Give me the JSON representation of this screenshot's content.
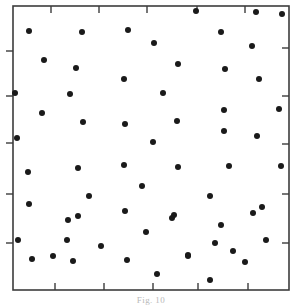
{
  "figure": {
    "title": "",
    "caption": "Fig. 10",
    "frame_color": "#3c3c3c",
    "point_color": "#1a1a1a",
    "background_color": "#ffffff"
  },
  "chart_data": {
    "type": "scatter",
    "title": "",
    "subtitle": "",
    "xlabel": "",
    "ylabel": "",
    "grid": false,
    "legend": null,
    "xlim": [
      0,
      100
    ],
    "ylim": [
      0,
      100
    ],
    "marker": "filled-circle",
    "marker_size_px": 4.2,
    "n_points": 62,
    "axes": {
      "top_ticks_x": [
        51,
        99,
        147,
        197,
        245
      ],
      "bottom_ticks_x": [
        55,
        104,
        153,
        198,
        248
      ],
      "left_ticks_y": [
        51,
        96,
        143,
        194,
        243
      ],
      "right_ticks_y": [
        48,
        96,
        144,
        194,
        243
      ],
      "tick_length_px": 7,
      "tick_direction": "inward",
      "left_tick_direction": "outward"
    },
    "frame": {
      "x": 13,
      "y": 6,
      "width": 276,
      "height": 284
    },
    "points_px": [
      [
        196,
        11
      ],
      [
        256,
        12
      ],
      [
        282,
        14
      ],
      [
        29,
        31
      ],
      [
        82,
        32
      ],
      [
        128,
        30
      ],
      [
        221,
        32
      ],
      [
        154,
        43
      ],
      [
        252,
        46
      ],
      [
        44,
        60
      ],
      [
        178,
        64
      ],
      [
        225,
        69
      ],
      [
        76,
        68
      ],
      [
        124,
        79
      ],
      [
        259,
        79
      ],
      [
        15,
        93
      ],
      [
        70,
        94
      ],
      [
        163,
        93
      ],
      [
        42,
        113
      ],
      [
        224,
        110
      ],
      [
        279,
        109
      ],
      [
        83,
        122
      ],
      [
        125,
        124
      ],
      [
        177,
        121
      ],
      [
        17,
        138
      ],
      [
        224,
        131
      ],
      [
        257,
        136
      ],
      [
        153,
        142
      ],
      [
        28,
        172
      ],
      [
        78,
        168
      ],
      [
        124,
        165
      ],
      [
        178,
        167
      ],
      [
        229,
        166
      ],
      [
        281,
        166
      ],
      [
        142,
        186
      ],
      [
        89,
        196
      ],
      [
        210,
        196
      ],
      [
        125,
        211
      ],
      [
        174,
        215
      ],
      [
        253,
        213
      ],
      [
        29,
        204
      ],
      [
        68,
        220
      ],
      [
        221,
        225
      ],
      [
        262,
        207
      ],
      [
        18,
        240
      ],
      [
        78,
        216
      ],
      [
        172,
        218
      ],
      [
        188,
        255
      ],
      [
        233,
        251
      ],
      [
        266,
        240
      ],
      [
        32,
        259
      ],
      [
        73,
        261
      ],
      [
        127,
        260
      ],
      [
        188,
        256
      ],
      [
        157,
        274
      ],
      [
        210,
        280
      ],
      [
        53,
        256
      ],
      [
        101,
        246
      ],
      [
        215,
        243
      ],
      [
        245,
        262
      ],
      [
        67,
        240
      ],
      [
        146,
        232
      ]
    ]
  }
}
